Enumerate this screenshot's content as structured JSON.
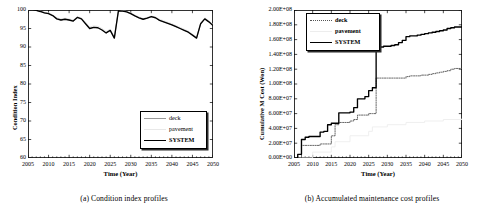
{
  "figure": {
    "panels": [
      {
        "id": "a",
        "caption": "(a) Condition index profiles",
        "chart_ref": 0
      },
      {
        "id": "b",
        "caption": "(b) Accumulated maintenance cost profiles",
        "chart_ref": 1
      }
    ]
  },
  "chart_data": [
    {
      "type": "line",
      "title": "",
      "xlabel": "Time (Year)",
      "ylabel": "Condition Index",
      "xlim": [
        2005,
        2050
      ],
      "ylim": [
        60,
        100
      ],
      "xticks": [
        2005,
        2010,
        2015,
        2020,
        2025,
        2030,
        2035,
        2040,
        2045,
        2050
      ],
      "yticks": [
        60,
        65,
        70,
        75,
        80,
        85,
        90,
        95,
        100
      ],
      "grid": false,
      "legend_position": "lower-right",
      "series": [
        {
          "name": "deck",
          "style": "solid-light",
          "color": "#9a9a9a",
          "x": [
            2005,
            2006,
            2007,
            2008,
            2009,
            2010,
            2011,
            2012,
            2013,
            2014,
            2015,
            2016,
            2017,
            2018,
            2019,
            2020,
            2021,
            2022,
            2023,
            2024,
            2025,
            2026,
            2027,
            2028,
            2029,
            2030,
            2031,
            2032,
            2033,
            2034,
            2035,
            2036,
            2037,
            2038,
            2039,
            2040,
            2041,
            2042,
            2043,
            2044,
            2045,
            2046,
            2047,
            2048,
            2049,
            2050
          ],
          "values": [
            100,
            100,
            99.9,
            99.6,
            99.2,
            99.0,
            98.5,
            97.6,
            97.3,
            97.5,
            97.3,
            97.0,
            98.0,
            97.6,
            96.3,
            95.0,
            95.3,
            95.2,
            94.6,
            93.8,
            94.5,
            92.4,
            99.8,
            99.7,
            99.5,
            99.0,
            98.4,
            97.9,
            97.5,
            97.8,
            98.2,
            97.9,
            97.2,
            96.8,
            96.4,
            96.0,
            95.5,
            95.0,
            94.5,
            94.0,
            93.2,
            92.4,
            96.3,
            97.6,
            96.8,
            95.8
          ]
        },
        {
          "name": "pavement",
          "style": "solid-faint",
          "color": "#e2e2e2",
          "x": [
            2005,
            2006,
            2007,
            2008,
            2009,
            2010,
            2011,
            2012,
            2013,
            2014,
            2015,
            2016,
            2017,
            2018,
            2019,
            2020,
            2021,
            2022,
            2023,
            2024,
            2025,
            2026,
            2027,
            2028,
            2029,
            2030,
            2031,
            2032,
            2033,
            2034,
            2035,
            2036,
            2037,
            2038,
            2039,
            2040,
            2041,
            2042,
            2043,
            2044,
            2045,
            2046,
            2047,
            2048,
            2049,
            2050
          ],
          "values": [
            100,
            100,
            99.9,
            99.7,
            99.4,
            99.2,
            98.7,
            97.9,
            97.6,
            97.8,
            97.6,
            97.3,
            98.2,
            97.9,
            96.7,
            95.4,
            95.7,
            95.6,
            95.0,
            94.2,
            94.8,
            92.8,
            99.9,
            99.8,
            99.6,
            99.2,
            98.6,
            98.1,
            97.7,
            98.0,
            98.4,
            98.1,
            97.5,
            97.1,
            96.7,
            96.3,
            95.8,
            95.3,
            94.8,
            94.3,
            93.5,
            92.7,
            96.6,
            97.9,
            97.1,
            96.1
          ]
        },
        {
          "name": "SYSTEM",
          "style": "solid-bold",
          "color": "#000000",
          "x": [
            2005,
            2006,
            2007,
            2008,
            2009,
            2010,
            2011,
            2012,
            2013,
            2014,
            2015,
            2016,
            2017,
            2018,
            2019,
            2020,
            2021,
            2022,
            2023,
            2024,
            2025,
            2026,
            2027,
            2028,
            2029,
            2030,
            2031,
            2032,
            2033,
            2034,
            2035,
            2036,
            2037,
            2038,
            2039,
            2040,
            2041,
            2042,
            2043,
            2044,
            2045,
            2046,
            2047,
            2048,
            2049,
            2050
          ],
          "values": [
            100,
            100,
            99.9,
            99.6,
            99.2,
            99.0,
            98.5,
            97.6,
            97.3,
            97.5,
            97.3,
            97.0,
            98.0,
            97.6,
            96.3,
            95.0,
            95.3,
            95.2,
            94.6,
            93.8,
            94.5,
            92.4,
            99.8,
            99.7,
            99.5,
            99.0,
            98.4,
            97.9,
            97.5,
            97.8,
            98.2,
            97.9,
            97.2,
            96.8,
            96.4,
            96.0,
            95.5,
            95.0,
            94.5,
            94.0,
            93.2,
            92.4,
            96.3,
            97.6,
            96.8,
            95.8
          ]
        }
      ],
      "legend": [
        {
          "label": "deck",
          "style": "solid-light"
        },
        {
          "label": "pavement",
          "style": "solid-faint"
        },
        {
          "label": "SYSTEM",
          "style": "solid-bold"
        }
      ]
    },
    {
      "type": "line",
      "title": "",
      "xlabel": "Time (Year)",
      "ylabel": "Cumulative M Cost (Won)",
      "xlim": [
        2005,
        2050
      ],
      "ylim": [
        0,
        200000000
      ],
      "xticks": [
        2005,
        2010,
        2015,
        2020,
        2025,
        2030,
        2035,
        2040,
        2045,
        2050
      ],
      "yticks": [
        0,
        20000000,
        40000000,
        60000000,
        80000000,
        100000000,
        120000000,
        140000000,
        160000000,
        180000000,
        200000000
      ],
      "ytick_labels": [
        "0.00E+00",
        "2.00E+07",
        "4.00E+07",
        "6.00E+07",
        "8.00E+07",
        "1.00E+08",
        "1.20E+08",
        "1.40E+08",
        "1.60E+08",
        "1.80E+08",
        "2.00E+08"
      ],
      "grid": false,
      "legend_position": "upper-left",
      "series": [
        {
          "name": "deck",
          "style": "dotted",
          "color": "#555555",
          "x": [
            2005,
            2006,
            2007,
            2008,
            2009,
            2010,
            2011,
            2012,
            2013,
            2014,
            2015,
            2016,
            2017,
            2018,
            2019,
            2020,
            2021,
            2022,
            2023,
            2024,
            2025,
            2026,
            2027,
            2028,
            2029,
            2030,
            2031,
            2032,
            2033,
            2034,
            2035,
            2036,
            2037,
            2038,
            2039,
            2040,
            2041,
            2042,
            2043,
            2044,
            2045,
            2046,
            2047,
            2048,
            2049,
            2050
          ],
          "values": [
            0,
            0,
            17000000,
            17000000,
            17000000,
            17000000,
            17000000,
            19000000,
            19000000,
            19000000,
            30000000,
            45000000,
            48000000,
            48000000,
            48000000,
            50000000,
            52000000,
            58000000,
            58000000,
            58000000,
            60000000,
            60000000,
            108000000,
            108000000,
            108000000,
            108000000,
            108000000,
            108000000,
            108000000,
            108000000,
            110000000,
            111000000,
            111000000,
            111000000,
            112000000,
            112000000,
            113000000,
            114000000,
            115000000,
            116000000,
            117000000,
            118000000,
            120000000,
            121000000,
            121000000,
            121000000
          ]
        },
        {
          "name": "pavement",
          "style": "faint",
          "color": "#ededed",
          "x": [
            2005,
            2010,
            2015,
            2016,
            2020,
            2025,
            2026,
            2030,
            2035,
            2040,
            2045,
            2050
          ],
          "values": [
            0,
            8000000,
            15000000,
            22000000,
            30000000,
            36000000,
            42000000,
            45000000,
            48000000,
            50000000,
            52000000,
            53000000
          ]
        },
        {
          "name": "SYSTEM",
          "style": "solid-bold",
          "color": "#000000",
          "x": [
            2005,
            2006,
            2007,
            2008,
            2009,
            2010,
            2011,
            2012,
            2013,
            2014,
            2015,
            2016,
            2017,
            2018,
            2019,
            2020,
            2021,
            2022,
            2023,
            2024,
            2025,
            2026,
            2027,
            2028,
            2029,
            2030,
            2031,
            2032,
            2033,
            2034,
            2035,
            2036,
            2037,
            2038,
            2039,
            2040,
            2041,
            2042,
            2043,
            2044,
            2045,
            2046,
            2047,
            2048,
            2049,
            2050
          ],
          "values": [
            0,
            5000000,
            25000000,
            28000000,
            29000000,
            29000000,
            29000000,
            35000000,
            36000000,
            45000000,
            47000000,
            47000000,
            61000000,
            61000000,
            61000000,
            62000000,
            68000000,
            80000000,
            80000000,
            83000000,
            91000000,
            95000000,
            150000000,
            150000000,
            151000000,
            151000000,
            152000000,
            153000000,
            156000000,
            159000000,
            164000000,
            165000000,
            165000000,
            166000000,
            167000000,
            168000000,
            169000000,
            170000000,
            171000000,
            172000000,
            173000000,
            175000000,
            176000000,
            177000000,
            177000000,
            177000000
          ]
        }
      ],
      "legend": [
        {
          "label": "deck",
          "style": "dotted"
        },
        {
          "label": "pavement",
          "style": "faint"
        },
        {
          "label": "SYSTEM",
          "style": "solid-bold"
        }
      ]
    }
  ]
}
